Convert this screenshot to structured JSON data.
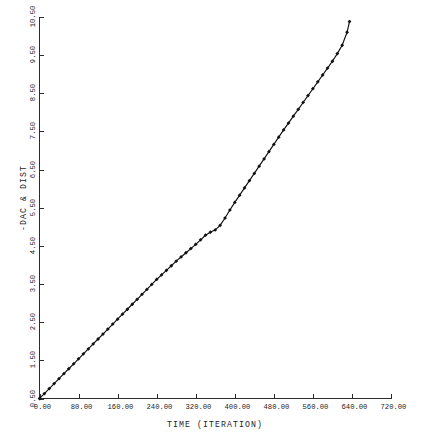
{
  "chart_data": {
    "type": "line",
    "title": "",
    "xlabel": "TIME (ITERATION)",
    "ylabel": "-DAC & DIST",
    "xlim": [
      0,
      720
    ],
    "ylim": [
      0.5,
      10.5
    ],
    "xticks": [
      0,
      80,
      160,
      240,
      320,
      400,
      480,
      560,
      640,
      720
    ],
    "xticklabels": [
      "0.00",
      "80.00",
      "160.00",
      "240.00",
      "320.00",
      "400.00",
      "480.00",
      "560.00",
      "640.00",
      "720.00"
    ],
    "yticks": [
      0.5,
      1.5,
      2.5,
      3.5,
      4.5,
      5.5,
      6.5,
      7.5,
      8.5,
      9.5,
      10.5
    ],
    "yticklabels": [
      "0.50",
      "1.50",
      "2.50",
      "3.50",
      "4.50",
      "5.50",
      "6.50",
      "7.50",
      "8.50",
      "9.50",
      "10.50"
    ],
    "grid": false,
    "legend": null,
    "marker": "filled-diamond",
    "line_color": "#111111",
    "axis_color": "#2b2b2b",
    "background": "#ffffff",
    "series": [
      {
        "name": "-DAC & DIST",
        "x": [
          0,
          10,
          20,
          30,
          40,
          50,
          60,
          70,
          80,
          90,
          100,
          110,
          120,
          130,
          140,
          150,
          160,
          170,
          180,
          190,
          200,
          210,
          220,
          230,
          240,
          250,
          260,
          270,
          280,
          290,
          300,
          310,
          320,
          330,
          340,
          350,
          360,
          370,
          380,
          390,
          400,
          410,
          420,
          430,
          440,
          450,
          460,
          470,
          480,
          490,
          500,
          510,
          520,
          530,
          540,
          550,
          560,
          570,
          580,
          590,
          600,
          610,
          620,
          630,
          635
        ],
        "y": [
          0.5,
          0.63,
          0.76,
          0.89,
          1.02,
          1.15,
          1.28,
          1.41,
          1.54,
          1.67,
          1.8,
          1.93,
          2.06,
          2.19,
          2.32,
          2.45,
          2.58,
          2.71,
          2.84,
          2.97,
          3.1,
          3.23,
          3.36,
          3.49,
          3.62,
          3.74,
          3.86,
          3.98,
          4.1,
          4.21,
          4.32,
          4.43,
          4.54,
          4.66,
          4.78,
          4.86,
          4.92,
          5.04,
          5.23,
          5.44,
          5.64,
          5.83,
          6.02,
          6.21,
          6.4,
          6.59,
          6.78,
          6.97,
          7.16,
          7.35,
          7.54,
          7.72,
          7.9,
          8.08,
          8.26,
          8.44,
          8.62,
          8.8,
          8.98,
          9.16,
          9.34,
          9.54,
          9.76,
          10.1,
          10.38
        ]
      }
    ],
    "annotations": [
      {
        "text": "knee / slope change",
        "x": 340,
        "y": 4.9
      }
    ]
  },
  "axes": {
    "x_title": "TIME (ITERATION)",
    "y_title": "-DAC & DIST"
  }
}
